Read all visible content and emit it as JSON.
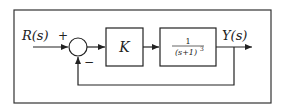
{
  "diagram": {
    "type": "feedback-control-block-diagram",
    "input_label": "R(s)",
    "output_label": "Y(s)",
    "summing_junction": {
      "plus_sign": "+",
      "minus_sign": "−"
    },
    "blocks": [
      {
        "id": "controller",
        "label": "K"
      },
      {
        "id": "plant",
        "numerator": "1",
        "denominator": "(s+1)",
        "exponent": "3"
      }
    ],
    "feedback": "unity negative feedback from Y(s) to summing junction"
  }
}
